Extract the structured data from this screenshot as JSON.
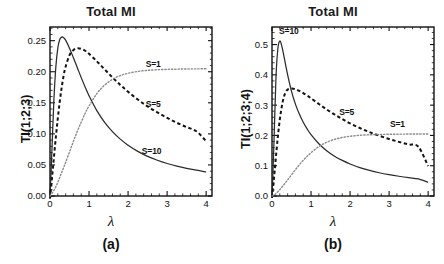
{
  "figure": {
    "panels": [
      {
        "id": "a",
        "title": "Total MI",
        "caption": "(a)",
        "ylabel": "TI(1;2;3)",
        "xlabel": "λ"
      },
      {
        "id": "b",
        "title": "Total MI",
        "caption": "(b)",
        "ylabel": "TI(1;2;3;4)",
        "xlabel": "λ"
      }
    ]
  },
  "chart_data": [
    {
      "type": "line",
      "panel": "a",
      "title": "Total MI",
      "caption": "(a)",
      "xlabel": "λ",
      "ylabel": "TI(1;2;3)",
      "xlim": [
        0,
        4.15
      ],
      "ylim": [
        0,
        0.272
      ],
      "xticks": [
        0,
        1,
        2,
        3,
        4
      ],
      "xticklabels": [
        "0",
        "1",
        "2",
        "3",
        "4"
      ],
      "yticks": [
        0.0,
        0.05,
        0.1,
        0.15,
        0.2,
        0.25
      ],
      "yticklabels": [
        "0.00",
        "0.05",
        "0.10",
        "0.15",
        "0.20",
        "0.25"
      ],
      "grid": false,
      "legend_position": "inline-annotations",
      "x": [
        0,
        0.05,
        0.1,
        0.15,
        0.2,
        0.25,
        0.3,
        0.35,
        0.4,
        0.5,
        0.6,
        0.7,
        0.8,
        0.9,
        1.0,
        1.2,
        1.4,
        1.6,
        1.8,
        2.0,
        2.25,
        2.5,
        2.75,
        3.0,
        3.25,
        3.5,
        3.75,
        4.0
      ],
      "series": [
        {
          "name": "S=10",
          "style": "solid",
          "color": "#2b2b2b",
          "peak": {
            "x": 0.33,
            "y": 0.256
          },
          "values": [
            -0.004,
            0.075,
            0.155,
            0.208,
            0.238,
            0.252,
            0.2558,
            0.2548,
            0.2508,
            0.238,
            0.2225,
            0.2065,
            0.1905,
            0.1755,
            0.1615,
            0.1375,
            0.1185,
            0.1035,
            0.0915,
            0.0818,
            0.0718,
            0.0638,
            0.0575,
            0.0523,
            0.048,
            0.0445,
            0.0415,
            0.0388
          ]
        },
        {
          "name": "S=5",
          "style": "dashed",
          "color": "#141414",
          "peak": {
            "x": 0.68,
            "y": 0.238
          },
          "values": [
            -0.004,
            0.028,
            0.062,
            0.095,
            0.125,
            0.152,
            0.175,
            0.194,
            0.208,
            0.2268,
            0.2348,
            0.2378,
            0.2368,
            0.2338,
            0.2288,
            0.2168,
            0.2038,
            0.1908,
            0.1788,
            0.1678,
            0.1552,
            0.1442,
            0.1345,
            0.1258,
            0.1178,
            0.1108,
            0.1042,
            0.0882
          ]
        },
        {
          "name": "S=1",
          "style": "dotted",
          "color": "#8a8a8a",
          "plateau": 0.205,
          "values": [
            0.0,
            0.004,
            0.009,
            0.015,
            0.022,
            0.03,
            0.038,
            0.046,
            0.054,
            0.071,
            0.088,
            0.104,
            0.119,
            0.133,
            0.145,
            0.1648,
            0.1785,
            0.1878,
            0.1938,
            0.1975,
            0.2005,
            0.2022,
            0.2032,
            0.2038,
            0.2042,
            0.2045,
            0.2046,
            0.2048
          ]
        }
      ],
      "annotations": [
        {
          "text": "S=1",
          "x": 2.45,
          "y": 0.213
        },
        {
          "text": "S=5",
          "x": 2.45,
          "y": 0.148
        },
        {
          "text": "S=10",
          "x": 2.35,
          "y": 0.072
        }
      ]
    },
    {
      "type": "line",
      "panel": "b",
      "title": "Total MI",
      "caption": "(b)",
      "xlabel": "λ",
      "ylabel": "TI(1;2;3;4)",
      "xlim": [
        0,
        4.15
      ],
      "ylim": [
        0,
        0.558
      ],
      "xticks": [
        0,
        1,
        2,
        3,
        4
      ],
      "xticklabels": [
        "0",
        "1",
        "2",
        "3",
        "4"
      ],
      "yticks": [
        0.0,
        0.1,
        0.2,
        0.3,
        0.4,
        0.5
      ],
      "yticklabels": [
        "0.0",
        "0.1",
        "0.2",
        "0.3",
        "0.4",
        "0.5"
      ],
      "grid": false,
      "legend_position": "inline-annotations",
      "x": [
        0,
        0.05,
        0.1,
        0.15,
        0.2,
        0.25,
        0.3,
        0.35,
        0.4,
        0.5,
        0.6,
        0.7,
        0.8,
        0.9,
        1.0,
        1.2,
        1.4,
        1.6,
        1.8,
        2.0,
        2.25,
        2.5,
        2.75,
        3.0,
        3.25,
        3.5,
        3.75,
        4.0
      ],
      "series": [
        {
          "name": "S=10",
          "style": "solid",
          "color": "#2b2b2b",
          "peak": {
            "x": 0.2,
            "y": 0.512
          },
          "values": [
            -0.006,
            0.175,
            0.385,
            0.486,
            0.512,
            0.4955,
            0.4655,
            0.4325,
            0.4005,
            0.3455,
            0.3035,
            0.2705,
            0.2435,
            0.2215,
            0.2025,
            0.1725,
            0.1495,
            0.1315,
            0.1175,
            0.1058,
            0.0938,
            0.0845,
            0.0768,
            0.0705,
            0.0652,
            0.0605,
            0.0565,
            0.0455
          ]
        },
        {
          "name": "S=5",
          "style": "dashed",
          "color": "#141414",
          "peak": {
            "x": 0.5,
            "y": 0.355
          },
          "values": [
            -0.006,
            0.058,
            0.128,
            0.196,
            0.252,
            0.295,
            0.325,
            0.343,
            0.3515,
            0.3552,
            0.3528,
            0.3472,
            0.3398,
            0.3315,
            0.3225,
            0.3038,
            0.2858,
            0.2692,
            0.2538,
            0.2398,
            0.2245,
            0.2108,
            0.1988,
            0.1882,
            0.1788,
            0.1702,
            0.1625,
            0.0985
          ]
        },
        {
          "name": "S=1",
          "style": "dotted",
          "color": "#8a8a8a",
          "plateau": 0.205,
          "values": [
            0.0,
            0.003,
            0.008,
            0.014,
            0.021,
            0.029,
            0.037,
            0.045,
            0.053,
            0.07,
            0.087,
            0.103,
            0.118,
            0.131,
            0.143,
            0.1632,
            0.1772,
            0.1868,
            0.1932,
            0.1972,
            0.2004,
            0.2022,
            0.2032,
            0.2038,
            0.2042,
            0.2045,
            0.2046,
            0.2048
          ]
        }
      ],
      "annotations": [
        {
          "text": "S=10",
          "x": 0.18,
          "y": 0.545
        },
        {
          "text": "S=5",
          "x": 1.72,
          "y": 0.278
        },
        {
          "text": "S=1",
          "x": 3.02,
          "y": 0.238
        }
      ]
    }
  ]
}
